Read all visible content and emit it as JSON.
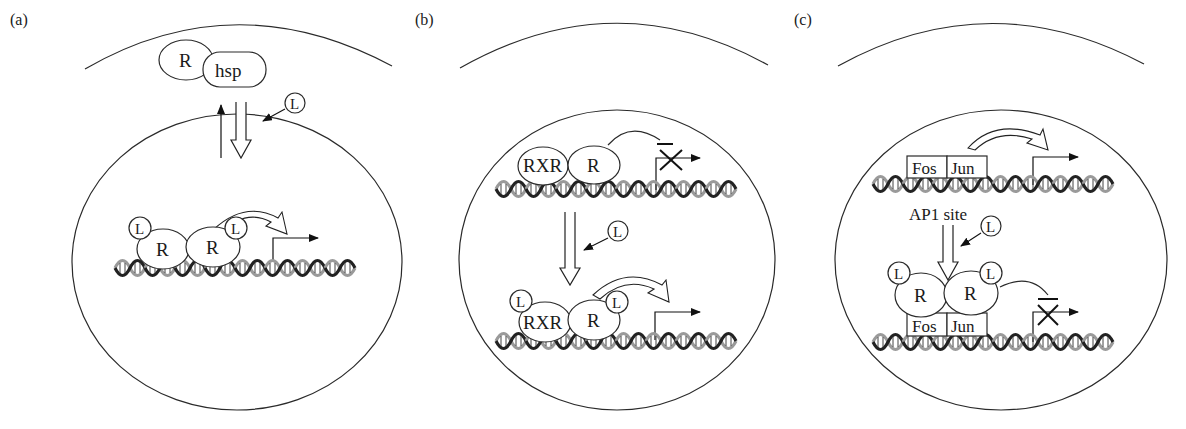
{
  "figure": {
    "panels": [
      {
        "label": "(a)",
        "cytoplasm_complex": {
          "receptor": "R",
          "chaperone": "hsp"
        },
        "ligand": "L",
        "nuclear_complex": {
          "ligands": [
            "L",
            "L"
          ],
          "receptors": [
            "R",
            "R"
          ]
        }
      },
      {
        "label": "(b)",
        "before": {
          "partners": [
            "RXR",
            "R"
          ],
          "transcription": "repressed"
        },
        "ligand": "L",
        "after": {
          "ligands": [
            "L",
            "L"
          ],
          "partners": [
            "RXR",
            "R"
          ],
          "transcription": "activated"
        }
      },
      {
        "label": "(c)",
        "before": {
          "factors": [
            "Fos",
            "Jun"
          ],
          "site_label": "AP1 site",
          "transcription": "activated"
        },
        "ligand": "L",
        "after": {
          "ligands": [
            "L",
            "L"
          ],
          "receptors": [
            "R",
            "R"
          ],
          "factors": [
            "Fos",
            "Jun"
          ],
          "transcription": "repressed"
        }
      }
    ]
  }
}
